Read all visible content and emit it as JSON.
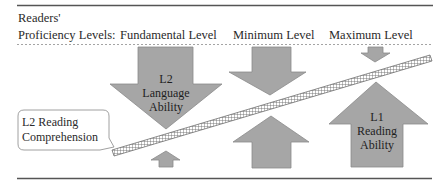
{
  "header": {
    "row_label_line1": "Readers'",
    "row_label_line2": "Proficiency Levels:",
    "levels": [
      {
        "label": "Fundamental Level"
      },
      {
        "label": "Minimum Level"
      },
      {
        "label": "Maximum Level"
      }
    ]
  },
  "arrows": {
    "l2_language_ability": {
      "line1": "L2",
      "line2": "Language",
      "line3": "Ability",
      "direction": "down"
    },
    "l1_reading_ability": {
      "line1": "L1",
      "line2": "Reading",
      "line3": "Ability",
      "direction": "up"
    }
  },
  "callout": {
    "line1": "L2 Reading",
    "line2": "Comprehension"
  },
  "colors": {
    "arrow_fill": "#a6a6a6",
    "arrow_stroke": "#8a8a8a",
    "rule": "#555555",
    "dashed_rule": "#999999",
    "hatch": "#6e6e6e"
  }
}
